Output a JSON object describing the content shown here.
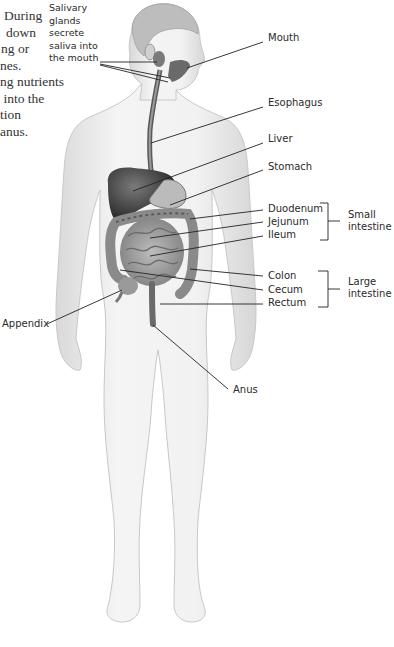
{
  "left_text": {
    "lines": [
      "During",
      "down",
      "ng or",
      "nes.",
      "ng nutrients",
      " into the",
      "tion",
      "anus."
    ]
  },
  "salivary_label": [
    "Salivary",
    "glands",
    "secrete",
    "saliva into",
    "the mouth"
  ],
  "labels": {
    "mouth": "Mouth",
    "esophagus": "Esophagus",
    "liver": "Liver",
    "stomach": "Stomach",
    "duodenum": "Duodenum",
    "jejunum": "Jejunum",
    "ileum": "Ileum",
    "colon": "Colon",
    "cecum": "Cecum",
    "rectum": "Rectum",
    "appendix": "Appendix",
    "anus": "Anus"
  },
  "groups": {
    "small_intestine": [
      "Small",
      "intestine"
    ],
    "large_intestine": [
      "Large",
      "intestine"
    ]
  },
  "colors": {
    "body": "#ececec",
    "organs_dark": "#3a3a3a",
    "organs_mid": "#8a8a8a",
    "leader": "#222222"
  }
}
